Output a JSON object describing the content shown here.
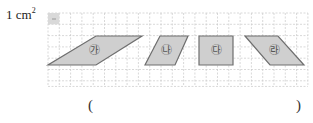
{
  "unit": {
    "label": "1 cm",
    "exponent": "2"
  },
  "grid": {
    "origin_x": 48,
    "origin_y": 13,
    "cell_px": 11.3,
    "columns": 23,
    "rows": 6.5,
    "line_color": "#c8c8c8"
  },
  "shapes": [
    {
      "id": "ga",
      "label": "㉮",
      "type": "parallelogram",
      "points": "48,65 96,65 142,36 96,36",
      "label_x": 94,
      "label_y": 50
    },
    {
      "id": "na",
      "label": "㉯",
      "type": "parallelogram",
      "points": "145,65 175,65 188,36 160,36",
      "label_x": 166,
      "label_y": 50
    },
    {
      "id": "da",
      "label": "㉰",
      "type": "rectangle",
      "points": "199,36 233,36 233,65 199,65",
      "label_x": 216,
      "label_y": 50
    },
    {
      "id": "ra",
      "label": "㉱",
      "type": "parallelogram",
      "points": "245,36 278,36 304,65 270,65",
      "label_x": 274,
      "label_y": 50
    }
  ],
  "colors": {
    "shape_fill": "#cfcfcf",
    "shape_stroke": "#6e6e6e",
    "unit_square_fill": "#d9d9d9"
  },
  "answer": {
    "open_paren": "(",
    "close_paren": ")",
    "value": ""
  }
}
